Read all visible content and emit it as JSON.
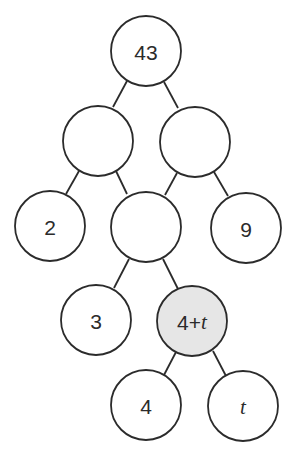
{
  "diagram": {
    "type": "factor-tree",
    "colors": {
      "stroke": "#2b2b2b",
      "fill": "#ffffff",
      "highlight_fill": "#e6e6e6"
    },
    "nodes": [
      {
        "id": "root",
        "label": "43",
        "cx": 146,
        "cy": 51,
        "r": 35,
        "highlight": false
      },
      {
        "id": "l1a",
        "label": "",
        "cx": 98,
        "cy": 141,
        "r": 35,
        "highlight": false
      },
      {
        "id": "l1b",
        "label": "",
        "cx": 195,
        "cy": 142,
        "r": 35,
        "highlight": false
      },
      {
        "id": "l2a",
        "label": "2",
        "cx": 50,
        "cy": 226,
        "r": 35,
        "highlight": false
      },
      {
        "id": "l2b",
        "label": "",
        "cx": 146,
        "cy": 227,
        "r": 35,
        "highlight": false
      },
      {
        "id": "l2c",
        "label": "9",
        "cx": 246,
        "cy": 228,
        "r": 35,
        "highlight": false
      },
      {
        "id": "l3a",
        "label": "3",
        "cx": 96,
        "cy": 320,
        "r": 35,
        "highlight": false
      },
      {
        "id": "l3b",
        "label_num": "4+",
        "label_var": "t",
        "cx": 192,
        "cy": 321,
        "r": 35,
        "highlight": true
      },
      {
        "id": "l4a",
        "label": "4",
        "cx": 146,
        "cy": 405,
        "r": 35,
        "highlight": false
      },
      {
        "id": "l4b",
        "label_var": "t",
        "cx": 243,
        "cy": 406,
        "r": 35,
        "highlight": false
      }
    ],
    "edges": [
      [
        "root",
        "l1a"
      ],
      [
        "root",
        "l1b"
      ],
      [
        "l1a",
        "l2a"
      ],
      [
        "l1a",
        "l2b"
      ],
      [
        "l1b",
        "l2b"
      ],
      [
        "l1b",
        "l2c"
      ],
      [
        "l2b",
        "l3a"
      ],
      [
        "l2b",
        "l3b"
      ],
      [
        "l3b",
        "l4a"
      ],
      [
        "l3b",
        "l4b"
      ]
    ]
  }
}
